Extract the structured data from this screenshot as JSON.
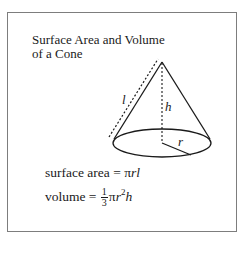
{
  "title": {
    "line1": "Surface Area and Volume",
    "line2": "of a Cone"
  },
  "diagram": {
    "labels": {
      "slant": "l",
      "height": "h",
      "radius": "r"
    }
  },
  "formulas": {
    "surface_area": {
      "lhs": "surface area = ",
      "pi": "π",
      "vars": "rl"
    },
    "volume": {
      "lhs": "volume = ",
      "frac_num": "1",
      "frac_den": "3",
      "pi": "π",
      "r": "r",
      "exp": "2",
      "h": "h"
    }
  },
  "colors": {
    "border": "#7d7d7d",
    "ink": "#1a1a1a"
  }
}
